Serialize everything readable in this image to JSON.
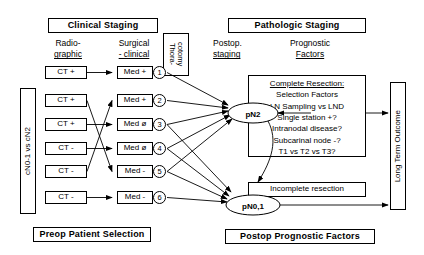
{
  "diagram": {
    "title_left": "Clinical Staging",
    "title_right": "Pathologic Staging",
    "col_left_l1": "Radio-",
    "col_left_l2": "graphic",
    "col_left2_l1": "Surgical",
    "col_left2_l2": "- clinical",
    "col_right_l1": "Postop.",
    "col_right_l2": "staging",
    "col_right2_l1": "Prognostic",
    "col_right2_l2": "Factors",
    "thoracotomy_l1": "Thora-",
    "thoracotomy_l2": "cotomy",
    "left_axis": "cN0-1   vs   cN2",
    "right_axis": "Long Term Outcome",
    "footer_left": "Preop Patient Selection",
    "footer_right": "Postop Prognostic Factors",
    "ct_nodes": [
      {
        "id": "1",
        "label": "CT +"
      },
      {
        "id": "2",
        "label": "CT +"
      },
      {
        "id": "3",
        "label": "CT +"
      },
      {
        "id": "4",
        "label": "CT -"
      },
      {
        "id": "5",
        "label": "CT -"
      },
      {
        "id": "6",
        "label": "CT -"
      }
    ],
    "med_nodes": [
      {
        "id": "1",
        "label": "Med +",
        "num": "1"
      },
      {
        "id": "2",
        "label": "Med +",
        "num": "2"
      },
      {
        "id": "3",
        "label": "Med ø",
        "num": "3"
      },
      {
        "id": "4",
        "label": "Med ø",
        "num": "4"
      },
      {
        "id": "5",
        "label": "Med -",
        "num": "5"
      },
      {
        "id": "6",
        "label": "Med -",
        "num": "6"
      }
    ],
    "stage_nodes": [
      {
        "id": "pn2",
        "label": "pN2"
      },
      {
        "id": "pn01",
        "label": "pN0,1"
      }
    ],
    "complete_resection": {
      "title": "Complete Resection:",
      "items": [
        "Selection Factors",
        "LN Sampling vs LND",
        "Single station +?",
        "Intranodal disease?",
        "Subcarinal node -?",
        "T1 vs T2 vs T3?"
      ]
    },
    "incomplete_resection": "Incomplete resection"
  }
}
